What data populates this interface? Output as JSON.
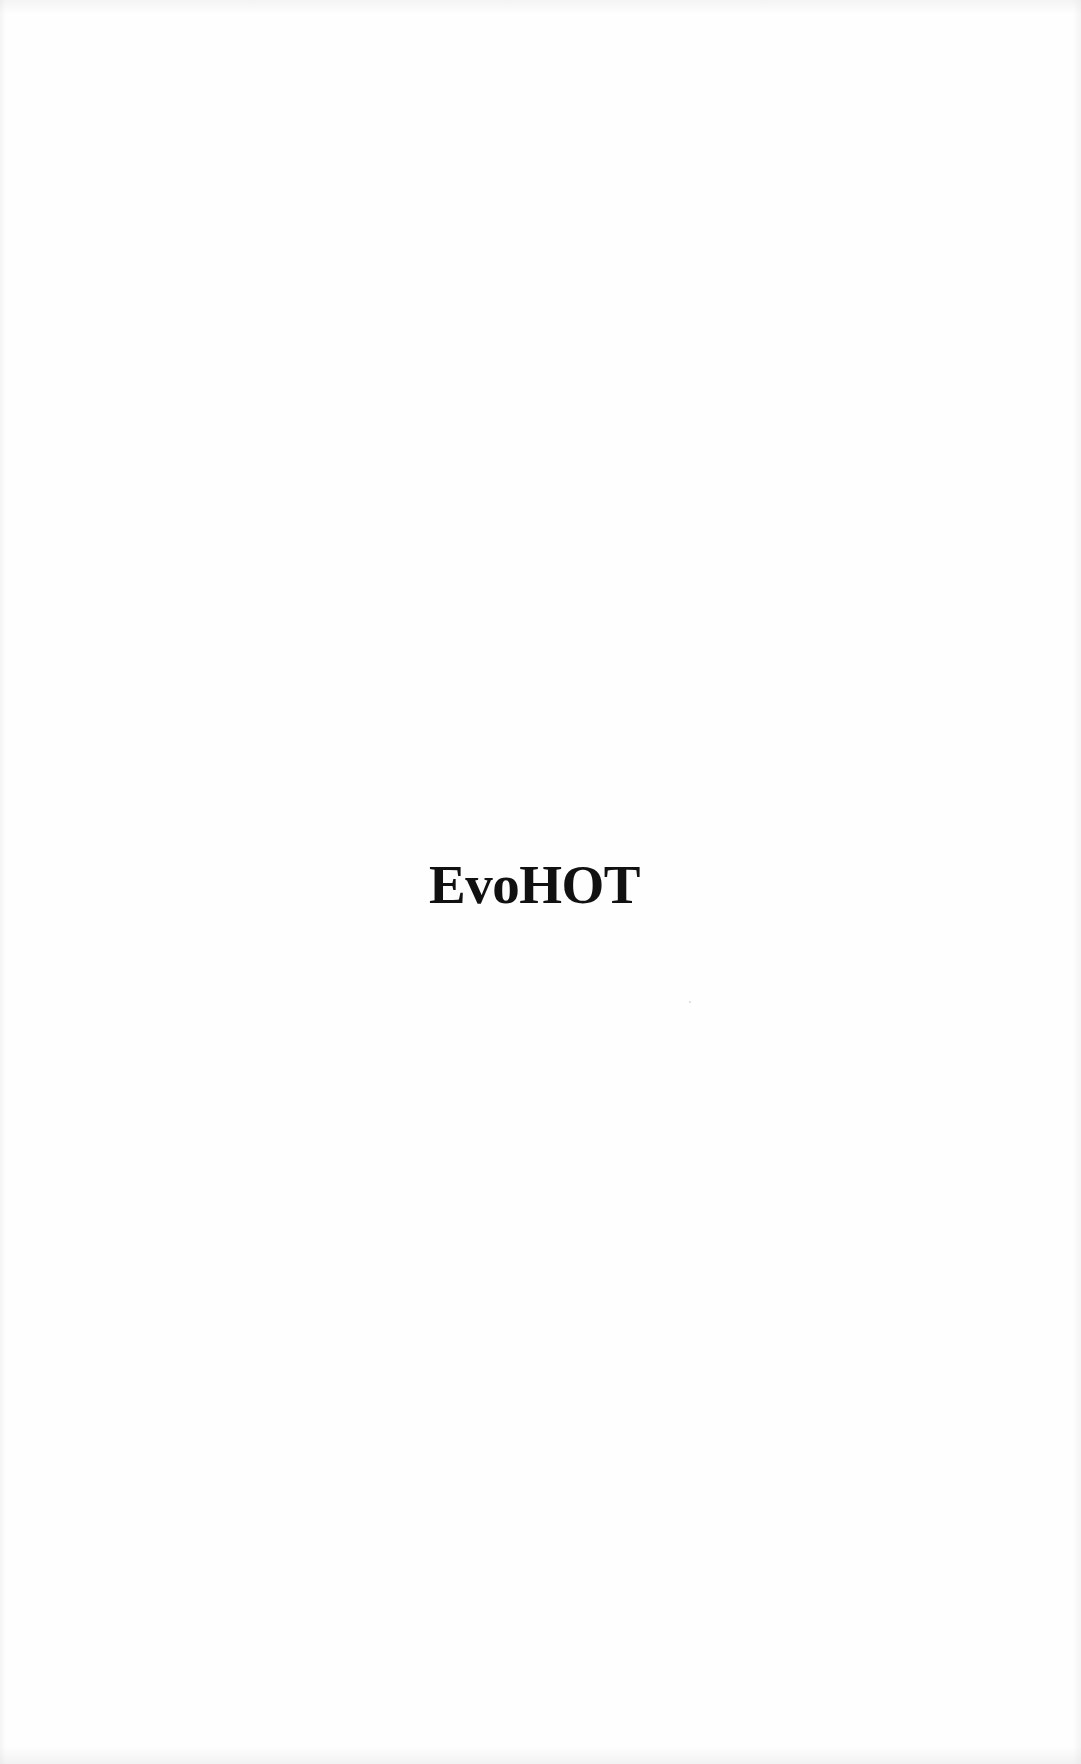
{
  "page": {
    "title": "EvoHOT",
    "background_color": "#fefefe",
    "text_color": "#111111"
  }
}
